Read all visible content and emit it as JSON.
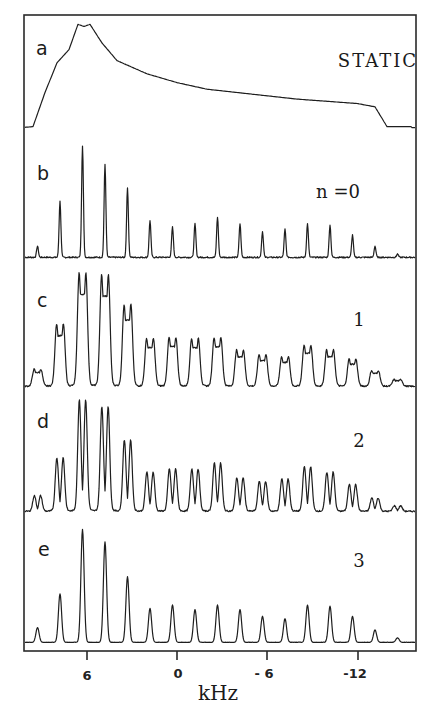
{
  "chart_data": {
    "type": "line",
    "title": "",
    "xlabel": "kHz",
    "ylabel": "",
    "x_reversed": true,
    "xlim": [
      10.4,
      -15.6
    ],
    "xticks": [
      6,
      0,
      -6,
      -12
    ],
    "xtick_labels": [
      "6",
      "0",
      "- 6",
      "-12"
    ],
    "grid": false,
    "legend": "none",
    "spinning_sideband_spacing_khz": 1.5,
    "panels": [
      {
        "label": "a",
        "annotation": "STATIC",
        "kind": "static_powder_pattern",
        "shape_points_khz_intensity": [
          [
            10.4,
            0.03
          ],
          [
            9.6,
            0.04
          ],
          [
            8.8,
            0.35
          ],
          [
            8.0,
            0.62
          ],
          [
            7.2,
            0.74
          ],
          [
            6.6,
            0.97
          ],
          [
            6.2,
            0.95
          ],
          [
            5.8,
            0.97
          ],
          [
            5.0,
            0.8
          ],
          [
            4.0,
            0.64
          ],
          [
            2.0,
            0.52
          ],
          [
            0.0,
            0.44
          ],
          [
            -2.0,
            0.38
          ],
          [
            -4.0,
            0.35
          ],
          [
            -6.0,
            0.32
          ],
          [
            -8.0,
            0.29
          ],
          [
            -10.0,
            0.27
          ],
          [
            -12.0,
            0.25
          ],
          [
            -13.2,
            0.22
          ],
          [
            -14.0,
            0.04
          ],
          [
            -15.6,
            0.04
          ]
        ]
      },
      {
        "label": "b",
        "annotation": "n =0",
        "kind": "sidebands_single",
        "peak_positions_khz": [
          9.3,
          7.8,
          6.3,
          4.8,
          3.3,
          1.8,
          0.3,
          -1.2,
          -2.7,
          -4.2,
          -5.7,
          -7.2,
          -8.7,
          -10.2,
          -11.7,
          -13.2,
          -14.7
        ],
        "peak_heights": [
          0.1,
          0.5,
          1.0,
          0.83,
          0.62,
          0.33,
          0.27,
          0.3,
          0.36,
          0.3,
          0.23,
          0.25,
          0.3,
          0.29,
          0.2,
          0.1,
          0.03
        ]
      },
      {
        "label": "c",
        "annotation": "1",
        "kind": "sidebands_split",
        "peak_positions_khz": [
          9.3,
          7.8,
          6.3,
          4.8,
          3.3,
          1.8,
          0.3,
          -1.2,
          -2.7,
          -4.2,
          -5.7,
          -7.2,
          -8.7,
          -10.2,
          -11.7,
          -13.2,
          -14.7
        ],
        "peak_heights": [
          0.15,
          0.55,
          1.0,
          0.98,
          0.72,
          0.42,
          0.43,
          0.42,
          0.43,
          0.32,
          0.28,
          0.26,
          0.36,
          0.32,
          0.24,
          0.14,
          0.06
        ]
      },
      {
        "label": "d",
        "annotation": "2",
        "kind": "sidebands_doublet",
        "peak_positions_khz": [
          9.3,
          7.8,
          6.3,
          4.8,
          3.3,
          1.8,
          0.3,
          -1.2,
          -2.7,
          -4.2,
          -5.7,
          -7.2,
          -8.7,
          -10.2,
          -11.7,
          -13.2,
          -14.7
        ],
        "peak_heights": [
          0.14,
          0.48,
          1.0,
          0.94,
          0.64,
          0.35,
          0.38,
          0.38,
          0.43,
          0.3,
          0.27,
          0.29,
          0.4,
          0.35,
          0.24,
          0.12,
          0.05
        ]
      },
      {
        "label": "e",
        "annotation": "3",
        "kind": "sidebands_single_broad",
        "peak_positions_khz": [
          9.3,
          7.8,
          6.3,
          4.8,
          3.3,
          1.8,
          0.3,
          -1.2,
          -2.7,
          -4.2,
          -5.7,
          -7.2,
          -8.7,
          -10.2,
          -11.7,
          -13.2,
          -14.7
        ],
        "peak_heights": [
          0.13,
          0.43,
          1.0,
          0.89,
          0.58,
          0.3,
          0.33,
          0.29,
          0.33,
          0.29,
          0.23,
          0.21,
          0.33,
          0.32,
          0.23,
          0.11,
          0.04
        ]
      }
    ]
  },
  "axis": {
    "label": "kHz",
    "ticks": [
      {
        "value": 6,
        "label": "6"
      },
      {
        "value": 0,
        "label": "0"
      },
      {
        "value": -6,
        "label": "- 6"
      },
      {
        "value": -12,
        "label": "-12"
      }
    ]
  },
  "panels": [
    {
      "label": "a",
      "annotation": "STATIC"
    },
    {
      "label": "b",
      "annotation": "n =0"
    },
    {
      "label": "c",
      "annotation": "1"
    },
    {
      "label": "d",
      "annotation": "2"
    },
    {
      "label": "e",
      "annotation": "3"
    }
  ]
}
